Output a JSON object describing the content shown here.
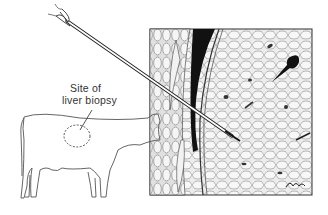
{
  "figure": {
    "label_line1": "Site of",
    "label_line2": "liver biopsy",
    "signature": "Reisel"
  },
  "colors": {
    "ink": "#1a1a1a",
    "paper": "#ffffff",
    "tissue": "#e6e6e6"
  }
}
